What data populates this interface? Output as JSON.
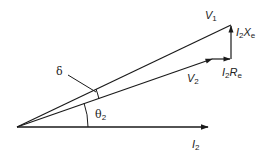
{
  "diagram": {
    "phasors": [
      {
        "name": "I2",
        "label_base": "I",
        "label_sub": "2",
        "from": [
          17,
          127
        ],
        "to": [
          208,
          127
        ]
      },
      {
        "name": "V2",
        "label_base": "V",
        "label_sub": "2",
        "prime": "'",
        "from": [
          17,
          127
        ],
        "to": [
          212,
          59
        ]
      },
      {
        "name": "V1",
        "label_base": "V",
        "label_sub": "1",
        "from": [
          17,
          127
        ],
        "to": [
          231,
          25
        ]
      },
      {
        "name": "I2Re",
        "label": "I2Re",
        "from": [
          212,
          59
        ],
        "to": [
          231,
          59
        ]
      },
      {
        "name": "I2Xe",
        "label": "I2Xe",
        "from": [
          231,
          59
        ],
        "to": [
          231,
          25
        ]
      }
    ],
    "labels": {
      "v1_base": "V",
      "v1_sub": "1",
      "v2_base": "V",
      "v2_sub": "2",
      "i2_base": "I",
      "i2_sub": "2",
      "i2xe_i": "I",
      "i2xe_sub": "2",
      "i2xe_x": "X",
      "i2xe_xsub": "e",
      "i2re_i": "I",
      "i2re_sub": "2",
      "i2re_r": "R",
      "i2re_rsub": "e",
      "delta": "δ",
      "theta_base": "θ",
      "theta_sub": "2"
    },
    "angles": [
      {
        "name": "delta",
        "label": "δ",
        "between": [
          "V2",
          "V1"
        ]
      },
      {
        "name": "theta2",
        "label": "θ2",
        "between": [
          "I2",
          "V2"
        ]
      }
    ],
    "line_color": "#1a1a1a"
  }
}
